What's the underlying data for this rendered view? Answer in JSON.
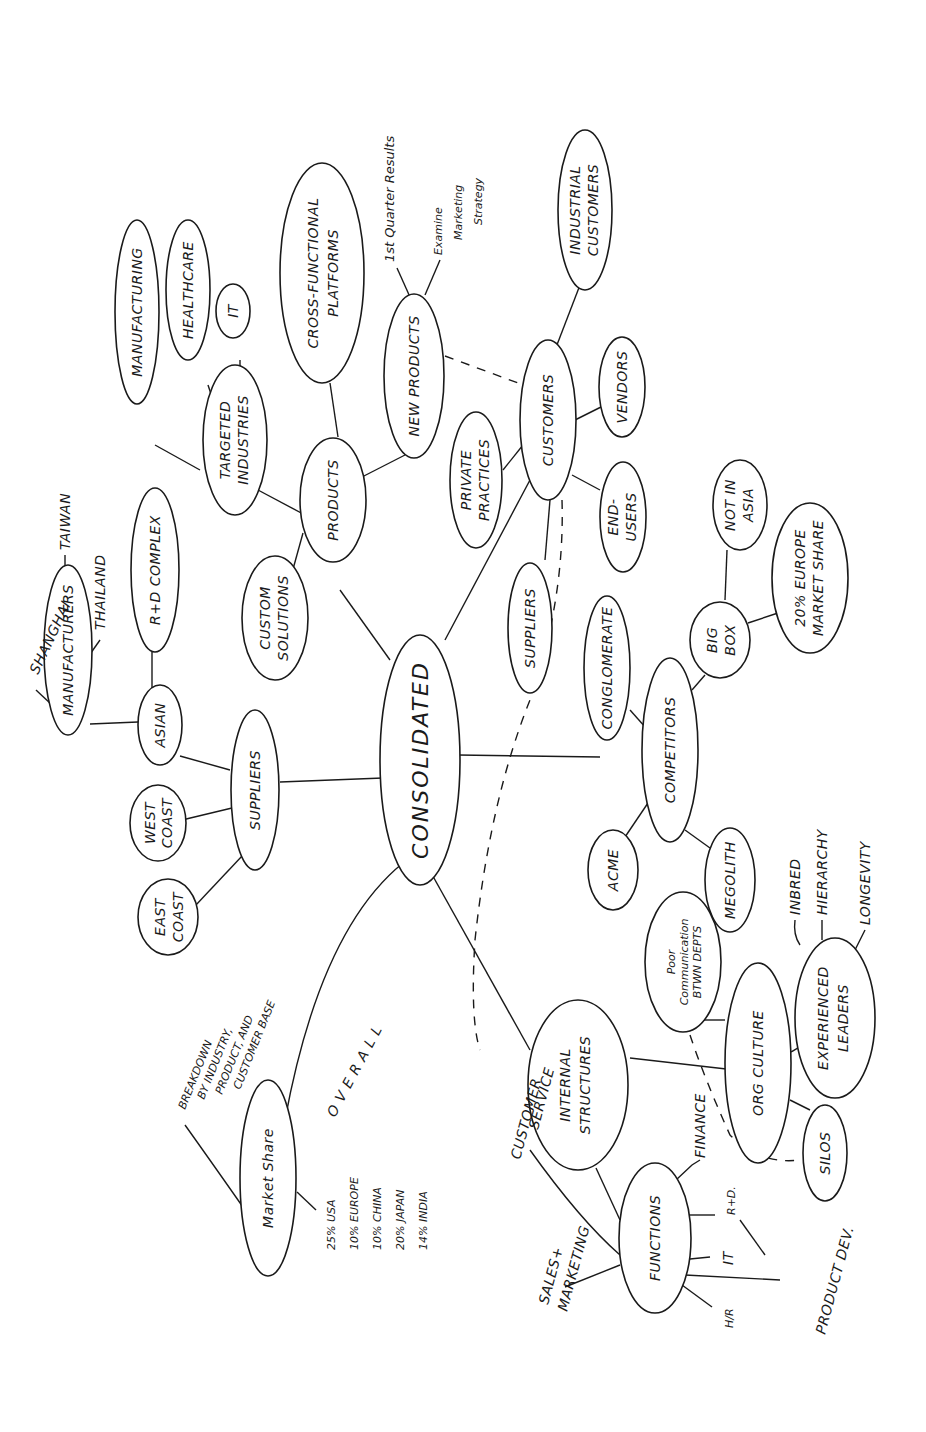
{
  "diagram": {
    "title": "CONSOLIDATED",
    "orientation": "rotated-90-ccw",
    "root": "CONSOLIDATED",
    "nodes": {
      "consolidated": "CONSOLIDATED",
      "suppliers": "SUPPLIERS",
      "asian": "ASIAN",
      "manufacturers": "MANUFACTURERS",
      "shanghai": "SHANGHAI",
      "taiwan": "TAIWAN",
      "thailand": "THAILAND",
      "rd_complex": "R+D COMPLEX",
      "west_coast_1": "WEST",
      "west_coast_2": "COAST",
      "east_coast_1": "EAST",
      "east_coast_2": "COAST",
      "products": "PRODUCTS",
      "custom_solutions_1": "CUSTOM",
      "custom_solutions_2": "SOLUTIONS",
      "targeted_industries_1": "TARGETED",
      "targeted_industries_2": "INDUSTRIES",
      "manufacturing": "MANUFACTURING",
      "healthcare": "HEALTHCARE",
      "it_industry": "IT",
      "cross_functional_1": "CROSS-FUNCTIONAL",
      "cross_functional_2": "PLATFORMS",
      "new_products": "NEW PRODUCTS",
      "first_quarter": "1st Quarter Results",
      "examine_1": "Examine",
      "examine_2": "Marketing",
      "examine_3": "Strategy",
      "customers": "CUSTOMERS",
      "industrial_customers_1": "INDUSTRIAL",
      "industrial_customers_2": "CUSTOMERS",
      "vendors": "VENDORS",
      "end_users_1": "END-",
      "end_users_2": "USERS",
      "private_practices_1": "PRIVATE",
      "private_practices_2": "PRACTICES",
      "customer_suppliers": "SUPPLIERS",
      "competitors": "COMPETITORS",
      "conglomerate": "CONGLOMERATE",
      "big_box_1": "BIG",
      "big_box_2": "BOX",
      "not_in_asia_1": "NOT IN",
      "not_in_asia_2": "ASIA",
      "europe_share_1": "20% EUROPE",
      "europe_share_2": "MARKET SHARE",
      "acme": "ACME",
      "megolith": "MEGOLITH",
      "internal_structures_1": "INTERNAL",
      "internal_structures_2": "STRUCTURES",
      "org_culture": "ORG CULTURE",
      "poor_comm_1": "Poor",
      "poor_comm_2": "Communication",
      "poor_comm_3": "BTWN DEPTS",
      "experienced_leaders_1": "EXPERIENCED",
      "experienced_leaders_2": "LEADERS",
      "inbred": "INBRED",
      "hierarchy": "HIERARCHY",
      "longevity": "LONGEVITY",
      "silos": "SILOS",
      "functions": "FUNCTIONS",
      "finance": "FINANCE",
      "rd": "R+D.",
      "product_dev": "PRODUCT DEV.",
      "it_function": "IT",
      "hr": "H/R",
      "sales_marketing_1": "SALES+",
      "sales_marketing_2": "MARKETING",
      "customer_service_1": "CUSTOMER",
      "customer_service_2": "SERVICE",
      "market_share": "Market Share",
      "breakdown_1": "BREAKDOWN",
      "breakdown_2": "BY INDUSTRY,",
      "breakdown_3": "PRODUCT, AND",
      "breakdown_4": "CUSTOMER BASE",
      "overall": "OVERALL",
      "share_usa": "25% USA",
      "share_europe": "10% EUROPE",
      "share_china": "10% CHINA",
      "share_japan": "20% JAPAN",
      "share_india": "14% INDIA"
    },
    "branches": [
      {
        "label": "SUPPLIERS",
        "children": [
          "ASIAN",
          "WEST COAST",
          "EAST COAST"
        ]
      },
      {
        "label": "ASIAN",
        "children": [
          "MANUFACTURERS",
          "R+D COMPLEX"
        ]
      },
      {
        "label": "MANUFACTURERS",
        "children": [
          "SHANGHAI",
          "TAIWAN",
          "THAILAND"
        ]
      },
      {
        "label": "PRODUCTS",
        "children": [
          "CUSTOM SOLUTIONS",
          "TARGETED INDUSTRIES",
          "CROSS-FUNCTIONAL PLATFORMS",
          "NEW PRODUCTS"
        ]
      },
      {
        "label": "TARGETED INDUSTRIES",
        "children": [
          "MANUFACTURING",
          "HEALTHCARE",
          "IT"
        ]
      },
      {
        "label": "NEW PRODUCTS",
        "children": [
          "1st Quarter Results",
          "Examine Marketing Strategy"
        ]
      },
      {
        "label": "CUSTOMERS",
        "children": [
          "INDUSTRIAL CUSTOMERS",
          "VENDORS",
          "END-USERS",
          "PRIVATE PRACTICES",
          "SUPPLIERS"
        ]
      },
      {
        "label": "COMPETITORS",
        "children": [
          "CONGLOMERATE",
          "BIG BOX",
          "ACME",
          "MEGOLITH"
        ]
      },
      {
        "label": "BIG BOX",
        "children": [
          "NOT IN ASIA",
          "20% EUROPE MARKET SHARE"
        ]
      },
      {
        "label": "INTERNAL STRUCTURES",
        "children": [
          "ORG CULTURE",
          "FUNCTIONS"
        ]
      },
      {
        "label": "ORG CULTURE",
        "children": [
          "Poor Communication BTWN DEPTS",
          "EXPERIENCED LEADERS",
          "SILOS"
        ]
      },
      {
        "label": "EXPERIENCED LEADERS",
        "children": [
          "INBRED",
          "HIERARCHY",
          "LONGEVITY"
        ]
      },
      {
        "label": "FUNCTIONS",
        "children": [
          "FINANCE",
          "R+D.",
          "PRODUCT DEV.",
          "IT",
          "H/R",
          "SALES+MARKETING",
          "CUSTOMER SERVICE"
        ]
      },
      {
        "label": "Market Share",
        "children": [
          "BREAKDOWN BY INDUSTRY, PRODUCT, AND CUSTOMER BASE",
          "OVERALL: 25% USA, 10% EUROPE, 10% CHINA, 20% JAPAN, 14% INDIA"
        ]
      }
    ],
    "dashed_links": [
      [
        "NEW PRODUCTS",
        "CUSTOMERS"
      ],
      [
        "CUSTOMERS",
        "CUSTOMER SERVICE"
      ],
      [
        "Poor Communication BTWN DEPTS",
        "SILOS"
      ]
    ]
  }
}
